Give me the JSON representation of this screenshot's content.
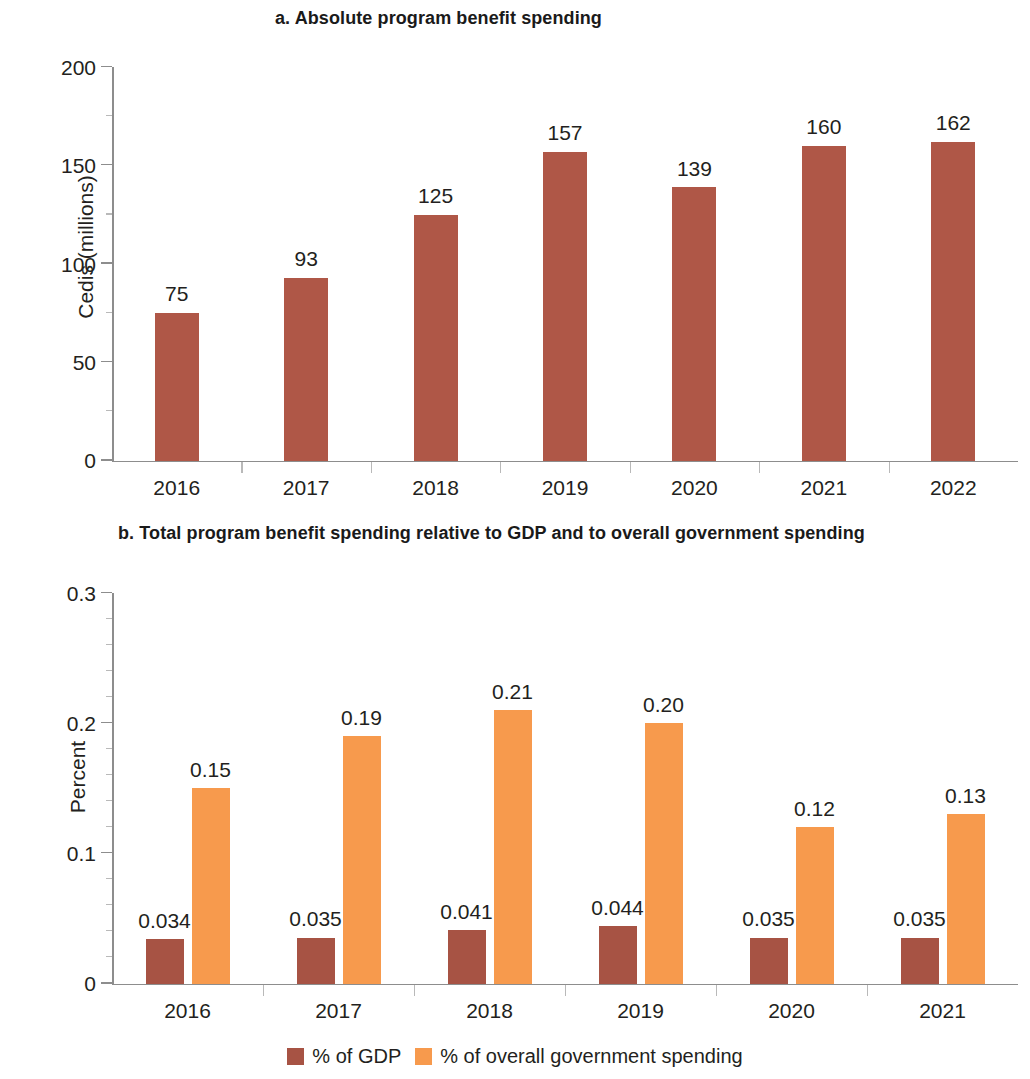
{
  "panel_a": {
    "title": "a. Absolute program benefit spending",
    "ylabel": "Cedis (millions)"
  },
  "panel_b": {
    "title": "b. Total program benefit spending relative to GDP and to overall government spending",
    "ylabel": "Percent"
  },
  "legend": {
    "items": [
      {
        "label": "% of GDP",
        "color": "#a75344"
      },
      {
        "label": "% of overall government spending",
        "color": "#f79a4d"
      }
    ]
  },
  "colors": {
    "gdp": "#a75344",
    "government_spending": "#f79a4d",
    "absolute_bar": "#af5747",
    "axis": "#8d8d8d",
    "text": "#231f20"
  },
  "chart_data": [
    {
      "type": "bar",
      "title": "a. Absolute program benefit spending",
      "xlabel": "",
      "ylabel": "Cedis (millions)",
      "categories": [
        "2016",
        "2017",
        "2018",
        "2019",
        "2020",
        "2021",
        "2022"
      ],
      "values": [
        75,
        93,
        125,
        157,
        139,
        160,
        162
      ],
      "value_labels": [
        "75",
        "93",
        "125",
        "157",
        "139",
        "160",
        "162"
      ],
      "ylim": [
        0,
        200
      ],
      "yticks": [
        0,
        50,
        100,
        150,
        200
      ],
      "ytick_labels": [
        "0",
        "50",
        "100",
        "150",
        "200"
      ],
      "grid": false,
      "legend": null,
      "series_color": "#af5747"
    },
    {
      "type": "bar",
      "title": "b. Total program benefit spending relative to GDP and to overall government spending",
      "xlabel": "",
      "ylabel": "Percent",
      "categories": [
        "2016",
        "2017",
        "2018",
        "2019",
        "2020",
        "2021"
      ],
      "series": [
        {
          "name": "% of GDP",
          "color": "#a75344",
          "values": [
            0.034,
            0.035,
            0.041,
            0.044,
            0.035,
            0.035
          ],
          "value_labels": [
            "0.034",
            "0.035",
            "0.041",
            "0.044",
            "0.035",
            "0.035"
          ]
        },
        {
          "name": "% of overall government spending",
          "color": "#f79a4d",
          "values": [
            0.15,
            0.19,
            0.21,
            0.2,
            0.12,
            0.13
          ],
          "value_labels": [
            "0.15",
            "0.19",
            "0.21",
            "0.20",
            "0.12",
            "0.13"
          ]
        }
      ],
      "ylim": [
        0,
        0.3
      ],
      "yticks": [
        0,
        0.1,
        0.2,
        0.3
      ],
      "ytick_labels": [
        "0",
        "0.1",
        "0.2",
        "0.3"
      ],
      "grid": false,
      "legend_position": "bottom-center"
    }
  ]
}
